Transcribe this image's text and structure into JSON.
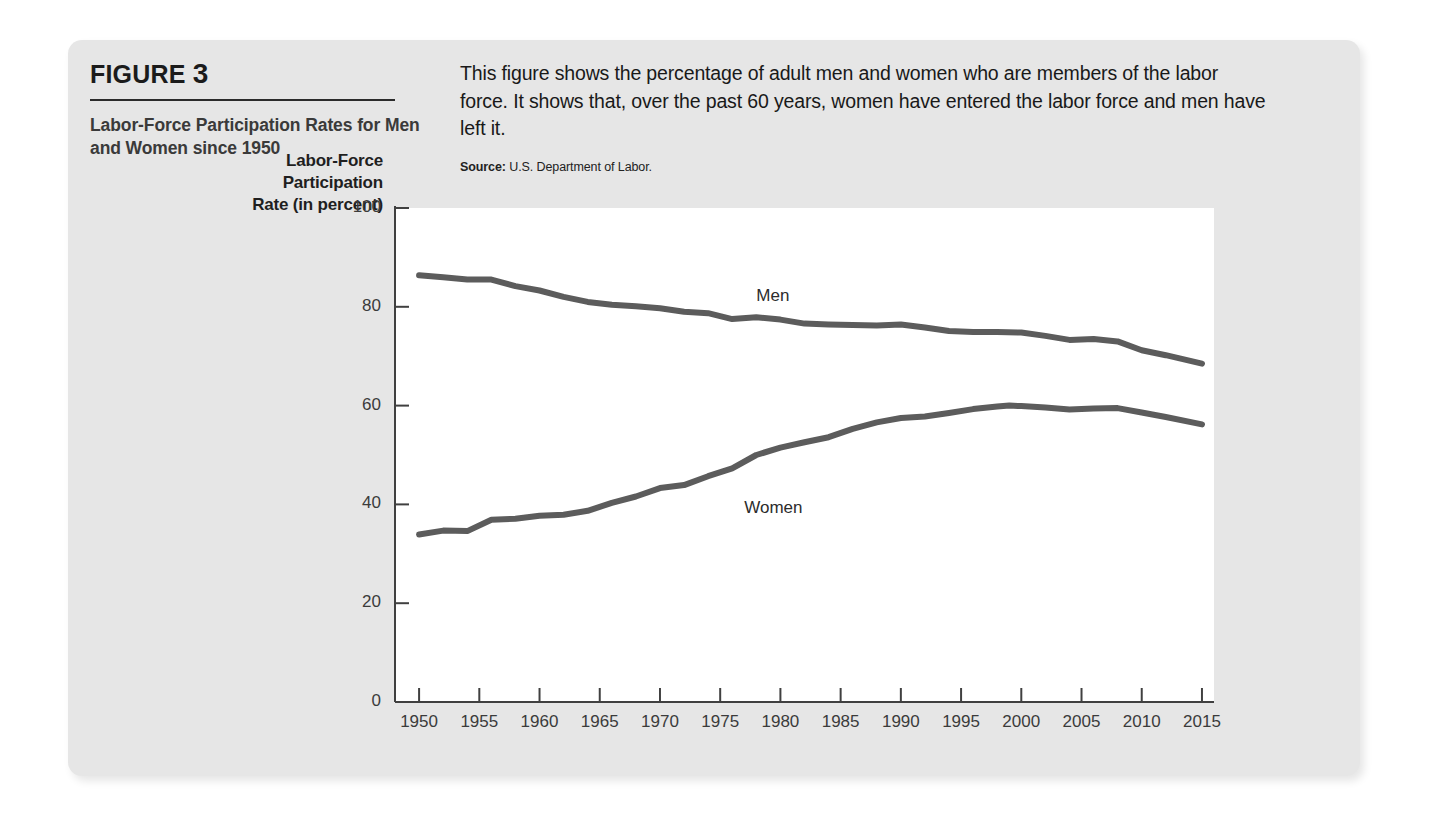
{
  "figure": {
    "number_label": "FIGURE",
    "number": "3",
    "subtitle": "Labor-Force Participation Rates for Men and Women since 1950",
    "description": "This figure shows the percentage of adult men and women who are members of the labor force. It shows that, over the past 60 years, women have entered the labor force and men have left it.",
    "source_label": "Source:",
    "source_text": "U.S. Department of Labor."
  },
  "chart_data": {
    "type": "line",
    "title": "Labor-Force Participation Rates for Men and Women since 1950",
    "xlabel": "",
    "ylabel": "Labor-Force Participation Rate (in percent)",
    "ylabel_lines": [
      "Labor-Force",
      "Participation",
      "Rate (in percent)"
    ],
    "xlim": [
      1948,
      2016
    ],
    "ylim": [
      0,
      100
    ],
    "yticks": [
      0,
      20,
      40,
      60,
      80,
      100
    ],
    "ytick_labels": [
      "0",
      "20",
      "40",
      "60",
      "80",
      "100"
    ],
    "xticks": [
      1950,
      1955,
      1960,
      1965,
      1970,
      1975,
      1980,
      1985,
      1990,
      1995,
      2000,
      2005,
      2010,
      2015
    ],
    "xtick_labels": [
      "1950",
      "1955",
      "1960",
      "1965",
      "1970",
      "1975",
      "1980",
      "1985",
      "1990",
      "1995",
      "2000",
      "2005",
      "2010",
      "2015"
    ],
    "grid": false,
    "legend_position": "inline-annotation",
    "line_color": "#5c5c5c",
    "series": [
      {
        "name": "Men",
        "label": "Men",
        "label_x": 1978,
        "label_y": 82,
        "x": [
          1950,
          1952,
          1954,
          1956,
          1958,
          1960,
          1962,
          1964,
          1966,
          1968,
          1970,
          1972,
          1974,
          1976,
          1978,
          1980,
          1982,
          1984,
          1986,
          1988,
          1990,
          1992,
          1994,
          1996,
          1998,
          2000,
          2002,
          2004,
          2006,
          2008,
          2010,
          2012,
          2015
        ],
        "values": [
          86.4,
          86.0,
          85.5,
          85.5,
          84.2,
          83.3,
          82.0,
          81.0,
          80.4,
          80.1,
          79.7,
          79.0,
          78.7,
          77.5,
          77.9,
          77.4,
          76.6,
          76.4,
          76.3,
          76.2,
          76.4,
          75.8,
          75.1,
          74.9,
          74.9,
          74.8,
          74.1,
          73.3,
          73.5,
          73.0,
          71.2,
          70.2,
          68.5
        ]
      },
      {
        "name": "Women",
        "label": "Women",
        "label_x": 1977,
        "label_y": 39,
        "x": [
          1950,
          1952,
          1954,
          1956,
          1958,
          1960,
          1962,
          1964,
          1966,
          1968,
          1970,
          1972,
          1974,
          1976,
          1978,
          1980,
          1982,
          1984,
          1986,
          1988,
          1990,
          1992,
          1994,
          1996,
          1998,
          1999,
          2000,
          2002,
          2004,
          2006,
          2008,
          2010,
          2012,
          2015
        ],
        "values": [
          33.9,
          34.7,
          34.6,
          36.9,
          37.1,
          37.7,
          37.9,
          38.7,
          40.3,
          41.6,
          43.3,
          43.9,
          45.7,
          47.3,
          50.0,
          51.5,
          52.6,
          53.6,
          55.3,
          56.6,
          57.5,
          57.8,
          58.5,
          59.3,
          59.8,
          60.0,
          59.9,
          59.6,
          59.2,
          59.4,
          59.5,
          58.6,
          57.7,
          56.2
        ]
      }
    ]
  }
}
